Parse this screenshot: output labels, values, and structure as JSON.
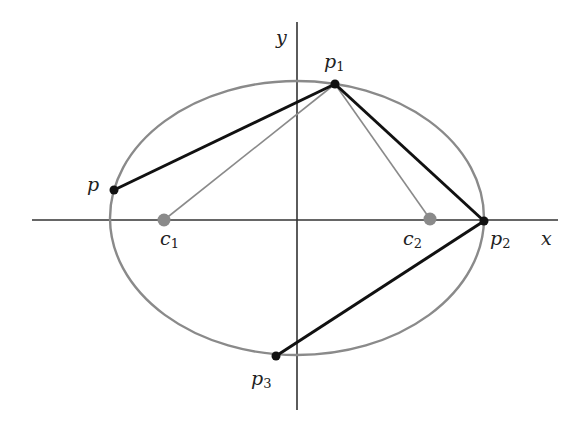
{
  "diagram": {
    "title": "",
    "colors": {
      "background": "#ffffff",
      "axis": "#333333",
      "ellipse": "#8a8a8a",
      "thick_line": "#111111",
      "thin_line": "#8a8a8a",
      "focus": "#8a8a8a",
      "point": "#111111"
    },
    "axes": {
      "x_label": "x",
      "y_label": "y"
    },
    "ellipse": {
      "cx": 297,
      "cy": 218,
      "rx": 187,
      "ry": 137
    },
    "foci": [
      {
        "id": "c1",
        "name": "c",
        "sub": "1",
        "x": 164,
        "y": 220
      },
      {
        "id": "c2",
        "name": "c",
        "sub": "2",
        "x": 430,
        "y": 219
      }
    ],
    "points": [
      {
        "id": "p",
        "name": "p",
        "sub": "",
        "x": 114,
        "y": 190
      },
      {
        "id": "p1",
        "name": "p",
        "sub": "1",
        "x": 335,
        "y": 84
      },
      {
        "id": "p2",
        "name": "p",
        "sub": "2",
        "x": 484,
        "y": 221
      },
      {
        "id": "p3",
        "name": "p",
        "sub": "3",
        "x": 276,
        "y": 356
      }
    ],
    "thick_segments": [
      [
        "p",
        "p1"
      ],
      [
        "p1",
        "p2"
      ],
      [
        "p2",
        "p3"
      ]
    ],
    "thin_segments": [
      [
        "c1",
        "p1"
      ],
      [
        "c2",
        "p1"
      ]
    ]
  }
}
